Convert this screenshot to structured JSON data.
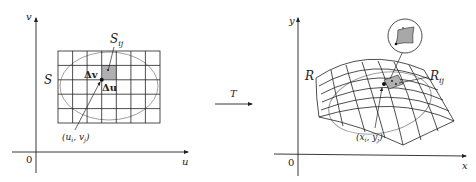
{
  "figure": {
    "left_panel": {
      "axis_vertical_label": "v",
      "axis_horizontal_label": "u",
      "origin_label": "0",
      "region_label": "S",
      "subregion_label": "S",
      "subregion_subscript": "ij",
      "delta_v_label": "Δv",
      "delta_u_label": "Δu",
      "point_label": "(u",
      "point_sub_i": "i",
      "point_mid": ", v",
      "point_sub_j": "j",
      "point_close": ")",
      "grid_columns": 7,
      "grid_rows": 5,
      "shaded_cell": {
        "column": 4,
        "row": 2
      }
    },
    "transformation": {
      "label": "T"
    },
    "right_panel": {
      "axis_vertical_label": "y",
      "axis_horizontal_label": "x",
      "origin_label": "0",
      "region_label": "R",
      "subregion_label": "R",
      "subregion_subscript": "ij",
      "point_label": "(x",
      "point_sub_i": "i",
      "point_mid": ", y",
      "point_sub_j": "j",
      "point_close": ")",
      "inset": "magnified view of R_ij"
    },
    "colors": {
      "line": "#222222",
      "ellipse": "#a0a0a0",
      "shade": "#b0b0b0"
    }
  }
}
